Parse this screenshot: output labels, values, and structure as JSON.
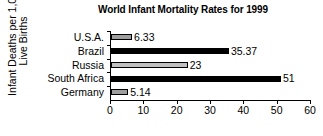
{
  "chart_data": {
    "type": "bar",
    "orientation": "horizontal",
    "title": "World Infant Mortality Rates for 1999",
    "xlabel": "",
    "ylabel": "Infant Deaths per 1,000\nLive Births",
    "categories": [
      "U.S.A.",
      "Brazil",
      "Russia",
      "South Africa",
      "Germany"
    ],
    "values": [
      6.33,
      35.37,
      23,
      51,
      5.14
    ],
    "value_labels": [
      "6.33",
      "35.37",
      "23",
      "51",
      "5.14"
    ],
    "bar_colors": [
      "#9e9e9e",
      "#000000",
      "#c0c0c0",
      "#000000",
      "#9e9e9e"
    ],
    "bar_edge_color": "#000000",
    "xlim": [
      0,
      60
    ],
    "xticks": [
      0,
      10,
      20,
      30,
      40,
      50,
      60
    ],
    "xtick_labels": [
      "0",
      "10",
      "20",
      "30",
      "40",
      "50",
      "60"
    ],
    "grid": false,
    "legend": false
  }
}
